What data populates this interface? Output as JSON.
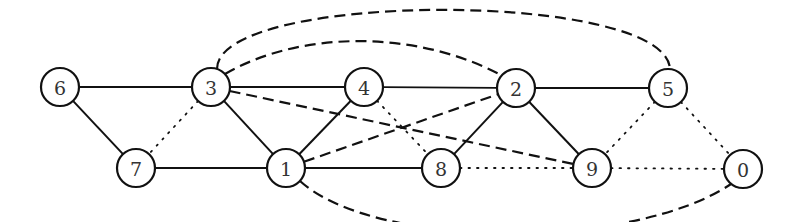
{
  "graph": {
    "radius": 19,
    "nodes": [
      {
        "id": "6",
        "label": "6",
        "x": 60,
        "y": 87
      },
      {
        "id": "3",
        "label": "3",
        "x": 211,
        "y": 87
      },
      {
        "id": "4",
        "label": "4",
        "x": 364,
        "y": 87
      },
      {
        "id": "2",
        "label": "2",
        "x": 516,
        "y": 88
      },
      {
        "id": "5",
        "label": "5",
        "x": 668,
        "y": 88
      },
      {
        "id": "7",
        "label": "7",
        "x": 136,
        "y": 168
      },
      {
        "id": "1",
        "label": "1",
        "x": 286,
        "y": 168
      },
      {
        "id": "8",
        "label": "8",
        "x": 441,
        "y": 168
      },
      {
        "id": "9",
        "label": "9",
        "x": 592,
        "y": 168
      },
      {
        "id": "0",
        "label": "0",
        "x": 743,
        "y": 169
      }
    ],
    "edges": [
      {
        "from": "6",
        "to": "3",
        "style": "solid"
      },
      {
        "from": "3",
        "to": "4",
        "style": "solid"
      },
      {
        "from": "4",
        "to": "2",
        "style": "solid"
      },
      {
        "from": "2",
        "to": "5",
        "style": "solid"
      },
      {
        "from": "6",
        "to": "7",
        "style": "solid"
      },
      {
        "from": "7",
        "to": "1",
        "style": "solid"
      },
      {
        "from": "3",
        "to": "1",
        "style": "solid"
      },
      {
        "from": "1",
        "to": "4",
        "style": "solid"
      },
      {
        "from": "1",
        "to": "8",
        "style": "solid"
      },
      {
        "from": "8",
        "to": "2",
        "style": "solid"
      },
      {
        "from": "2",
        "to": "9",
        "style": "solid"
      },
      {
        "from": "3",
        "to": "5",
        "style": "dashed",
        "curve": "arc-top-high"
      },
      {
        "from": "3",
        "to": "2",
        "style": "dashed",
        "curve": "arc-top-low"
      },
      {
        "from": "3",
        "to": "9",
        "style": "dashed"
      },
      {
        "from": "1",
        "to": "2",
        "style": "dashed"
      },
      {
        "from": "1",
        "to": "0",
        "style": "dashed",
        "curve": "arc-bottom"
      },
      {
        "from": "3",
        "to": "7",
        "style": "dotted"
      },
      {
        "from": "4",
        "to": "8",
        "style": "dotted"
      },
      {
        "from": "5",
        "to": "9",
        "style": "dotted"
      },
      {
        "from": "5",
        "to": "0",
        "style": "dotted"
      },
      {
        "from": "8",
        "to": "9",
        "style": "dotted"
      },
      {
        "from": "9",
        "to": "0",
        "style": "dotted"
      }
    ]
  }
}
